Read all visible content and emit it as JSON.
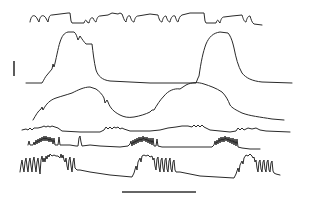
{
  "figure": {
    "type": "physiological multi-trace recording",
    "background": "#ffffff",
    "stroke_color": "#2a2a2a",
    "traces": [
      {
        "id": "trace-1",
        "description": "top trace, square-wave-like fluctuations"
      },
      {
        "id": "trace-2",
        "description": "two large plateau waves"
      },
      {
        "id": "trace-3",
        "description": "slow broad oscillation"
      },
      {
        "id": "trace-4",
        "description": "low-amplitude baseline with small bursts"
      },
      {
        "id": "trace-5",
        "description": "rhythmic bursting activity with pauses"
      },
      {
        "id": "trace-6",
        "description": "large rhythmic oscillations interrupted by slow decays"
      }
    ],
    "scale_bars": {
      "vertical": {
        "label": ""
      },
      "horizontal": {
        "label": ""
      }
    }
  }
}
